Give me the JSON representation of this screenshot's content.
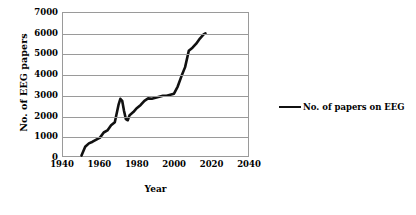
{
  "chart_data": {
    "type": "line",
    "title": "",
    "xlabel": "Year",
    "ylabel": "No. of EEG papers",
    "xlim": [
      1940,
      2040
    ],
    "ylim": [
      0,
      7000
    ],
    "xticks": [
      1940,
      1960,
      1980,
      2000,
      2020,
      2040
    ],
    "yticks": [
      0,
      1000,
      2000,
      3000,
      4000,
      5000,
      6000,
      7000
    ],
    "grid": "horizontal",
    "legend_position": "right",
    "series": [
      {
        "name": "No. of papers on EEG",
        "color": "#111111",
        "x": [
          1950,
          1952,
          1954,
          1956,
          1958,
          1960,
          1962,
          1964,
          1966,
          1968,
          1970,
          1971,
          1972,
          1973,
          1974,
          1975,
          1976,
          1978,
          1980,
          1982,
          1984,
          1986,
          1988,
          1990,
          1992,
          1994,
          1996,
          1998,
          2000,
          2002,
          2004,
          2006,
          2008,
          2010,
          2012,
          2014,
          2016,
          2017
        ],
        "values": [
          20,
          450,
          620,
          700,
          800,
          900,
          1150,
          1250,
          1500,
          1650,
          2500,
          2800,
          2700,
          2200,
          1800,
          1750,
          2000,
          2150,
          2350,
          2500,
          2700,
          2820,
          2800,
          2850,
          2900,
          2950,
          2950,
          3000,
          3050,
          3400,
          3900,
          4350,
          5150,
          5300,
          5500,
          5750,
          5950,
          6000
        ]
      }
    ]
  },
  "legend": {
    "entries": [
      {
        "label": "No. of papers on EEG",
        "color": "#111111"
      }
    ]
  }
}
